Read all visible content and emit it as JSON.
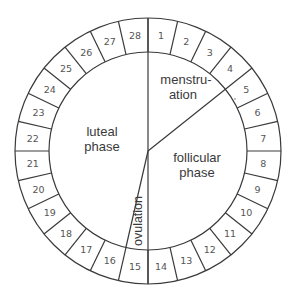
{
  "diagram": {
    "days": [
      "1",
      "2",
      "3",
      "4",
      "5",
      "6",
      "7",
      "8",
      "9",
      "10",
      "11",
      "12",
      "13",
      "14",
      "15",
      "16",
      "17",
      "18",
      "19",
      "20",
      "21",
      "22",
      "23",
      "24",
      "25",
      "26",
      "27",
      "28"
    ],
    "phases": {
      "menstruation": {
        "line1": "menstru-",
        "line2": "ation"
      },
      "follicular": {
        "line1": "follicular",
        "line2": "phase"
      },
      "luteal": {
        "line1": "luteal",
        "line2": "phase"
      },
      "ovulation": {
        "label": "ovulation"
      }
    },
    "colors": {
      "line": "#3a3a3a",
      "text": "#555555",
      "background": "#ffffff"
    },
    "geometry": {
      "cx": 148,
      "cy": 151,
      "outer_r": 133,
      "inner_r": 99,
      "segments": 28
    }
  }
}
